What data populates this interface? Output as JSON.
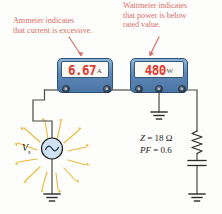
{
  "figure": {
    "type": "circuit-diagram"
  },
  "annotations": {
    "ammeter_note": [
      "Ammeter indicates",
      "that current is excessive."
    ],
    "wattmeter_note": [
      "Wattmeter indicates",
      "that power is below",
      "rated value."
    ],
    "color": "#d8706a"
  },
  "meters": {
    "ammeter": {
      "name": "Ammeter",
      "reading": "6.67",
      "unit": "A",
      "terminals": 2,
      "digit_color": "#e03a32",
      "body_color": "#5d87b4"
    },
    "wattmeter": {
      "name": "Wattmeter",
      "reading": "480",
      "unit": "W",
      "terminals": 3,
      "digit_color": "#e03a32",
      "body_color": "#5d87b4"
    }
  },
  "source": {
    "symbol": "ac-source",
    "label": "V",
    "subscript": "s",
    "circle_color": "#cfe2f2",
    "ray_color": "#e8b93f"
  },
  "load": {
    "impedance_label": "Z",
    "impedance_value": "= 18 Ω",
    "pf_label": "PF",
    "pf_value": "= 0.6",
    "elements": [
      "resistor",
      "capacitor",
      "ground"
    ]
  },
  "grounds": {
    "count": 3,
    "positions": [
      "source",
      "wattmeter",
      "load"
    ]
  },
  "colors": {
    "wire": "#4a4a4a",
    "background": "#fdfdfb",
    "annotation": "#d8706a"
  }
}
